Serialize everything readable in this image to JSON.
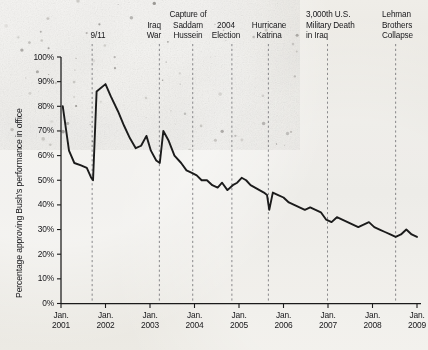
{
  "chart_data": {
    "type": "line",
    "title": "",
    "xlabel": "",
    "ylabel": "Percentage approving Bush's performance in office",
    "ylim": [
      0,
      100
    ],
    "xlim": [
      2001.0,
      2009.0
    ],
    "grid": false,
    "legend": "none",
    "ytick_labels": [
      "100%",
      "90%",
      "80%",
      "70%",
      "60%",
      "50%",
      "40%",
      "30%",
      "20%",
      "10%",
      "0%"
    ],
    "ytick_values": [
      100,
      90,
      80,
      70,
      60,
      50,
      40,
      30,
      20,
      10,
      0
    ],
    "xtick_labels": [
      [
        "Jan.",
        "2001"
      ],
      [
        "Jan.",
        "2002"
      ],
      [
        "Jan.",
        "2003"
      ],
      [
        "Jan.",
        "2004"
      ],
      [
        "Jan.",
        "2005"
      ],
      [
        "Jan.",
        "2006"
      ],
      [
        "Jan.",
        "2007"
      ],
      [
        "Jan.",
        "2008"
      ],
      [
        "Jan.",
        "2009"
      ]
    ],
    "xtick_values": [
      2001,
      2002,
      2003,
      2004,
      2005,
      2006,
      2007,
      2008,
      2009
    ],
    "series": [
      {
        "name": "Bush approval rating",
        "color": "#1b1b1b",
        "x": [
          2001.04,
          2001.18,
          2001.3,
          2001.45,
          2001.58,
          2001.68,
          2001.72,
          2001.8,
          2002.0,
          2002.12,
          2002.28,
          2002.42,
          2002.55,
          2002.68,
          2002.8,
          2002.92,
          2003.02,
          2003.14,
          2003.22,
          2003.3,
          2003.42,
          2003.55,
          2003.7,
          2003.82,
          2003.94,
          2004.05,
          2004.16,
          2004.28,
          2004.4,
          2004.52,
          2004.62,
          2004.74,
          2004.86,
          2004.96,
          2005.06,
          2005.16,
          2005.26,
          2005.36,
          2005.46,
          2005.56,
          2005.63,
          2005.68,
          2005.76,
          2005.88,
          2006.0,
          2006.12,
          2006.24,
          2006.36,
          2006.48,
          2006.6,
          2006.72,
          2006.84,
          2006.96,
          2007.08,
          2007.2,
          2007.32,
          2007.44,
          2007.56,
          2007.68,
          2007.8,
          2007.92,
          2008.04,
          2008.16,
          2008.28,
          2008.4,
          2008.52,
          2008.64,
          2008.76,
          2008.88,
          2009.0
        ],
        "y": [
          80,
          62,
          57,
          56,
          55,
          51,
          50,
          86,
          89,
          84,
          78,
          72,
          67,
          63,
          64,
          68,
          62,
          58,
          57,
          70,
          66,
          60,
          57,
          54,
          53,
          52,
          50,
          50,
          48,
          47,
          49,
          46,
          48,
          49,
          51,
          50,
          48,
          47,
          46,
          45,
          44,
          38,
          45,
          44,
          43,
          41,
          40,
          39,
          38,
          39,
          38,
          37,
          34,
          33,
          35,
          34,
          33,
          32,
          31,
          32,
          33,
          31,
          30,
          29,
          28,
          27,
          28,
          30,
          28,
          27
        ]
      }
    ],
    "annotations": [
      {
        "label": "9/11",
        "lines": [
          "9/11"
        ],
        "x": 2001.7,
        "text_x": 76,
        "text_width": 44,
        "align": "center"
      },
      {
        "label": "Iraq War",
        "lines": [
          "Iraq",
          "War"
        ],
        "x": 2003.21,
        "text_x": 142,
        "text_width": 24,
        "align": "center"
      },
      {
        "label": "Capture of Saddam Hussein",
        "lines": [
          "Capture of",
          "Saddam",
          "Hussein"
        ],
        "x": 2003.96,
        "text_x": 166,
        "text_width": 44,
        "align": "center"
      },
      {
        "label": "2004 Election",
        "lines": [
          "2004",
          "Election"
        ],
        "x": 2004.84,
        "text_x": 206,
        "text_width": 40,
        "align": "center"
      },
      {
        "label": "Hurricane Katrina",
        "lines": [
          "Hurricane",
          "Katrina"
        ],
        "x": 2005.66,
        "text_x": 246,
        "text_width": 46,
        "align": "center"
      },
      {
        "label": "3,000th U.S. Military Death in Iraq",
        "lines": [
          "3,000th U.S.",
          "Military Death",
          "in Iraq"
        ],
        "x": 2006.99,
        "text_x": 306,
        "text_width": 58,
        "align": "left"
      },
      {
        "label": "Lehman Brothers Collapse",
        "lines": [
          "Lehman",
          "Brothers",
          "Collapse"
        ],
        "x": 2008.52,
        "text_x": 382,
        "text_width": 44,
        "align": "left"
      }
    ]
  },
  "style": {
    "axis_color": "#1b1b1b",
    "line_color": "#1b1b1b",
    "dash_color": "#55555a",
    "text_color": "#17171a",
    "paper_color": "#e9e7e2"
  }
}
